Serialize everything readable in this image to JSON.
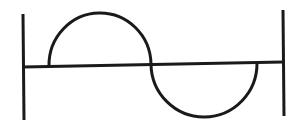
{
  "diagram": {
    "stroke_color": "#1a1a1a",
    "background": "#ffffff",
    "stroke_width": 3,
    "elements": {
      "left_boundary": {
        "x1": 23,
        "y1": 14,
        "x2": 24,
        "y2": 120
      },
      "right_boundary": {
        "x1": 283,
        "y1": 10,
        "x2": 284,
        "y2": 116
      },
      "axis": {
        "x1": 23,
        "y1": 67,
        "x2": 283,
        "y2": 62
      },
      "upper_arc": {
        "start": [
          49,
          66
        ],
        "end": [
          151,
          64
        ],
        "peak_y": 13
      },
      "lower_arc": {
        "start": [
          151,
          64
        ],
        "end": [
          257,
          63
        ],
        "trough_y": 117
      }
    }
  }
}
